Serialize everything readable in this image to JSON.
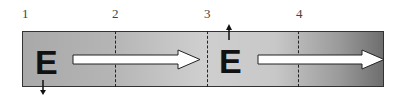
{
  "diagram": {
    "position_labels": [
      "1",
      "2",
      "3",
      "4"
    ],
    "block_letters": [
      "E",
      "E"
    ],
    "arrows": [
      {
        "type": "flow",
        "direction": "right",
        "from_position": 1,
        "to_position": 3
      },
      {
        "type": "flow",
        "direction": "right",
        "from_position": 3,
        "to_position": "end"
      },
      {
        "type": "small",
        "direction": "down",
        "at": "first E"
      },
      {
        "type": "small",
        "direction": "up",
        "at": "second E"
      }
    ],
    "colors": {
      "box_left": "#a9a9a9",
      "box_middle": "#cfcfcf",
      "box_right": "#6e6e6e",
      "arrow_fill": "#ffffff",
      "stroke": "#222222"
    }
  }
}
